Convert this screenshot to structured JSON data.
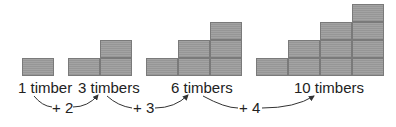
{
  "diagram": {
    "groups": [
      {
        "label": "1 timber",
        "count": 1,
        "columns": [
          1
        ]
      },
      {
        "label": "3 timbers",
        "count": 3,
        "columns": [
          1,
          2
        ]
      },
      {
        "label": "6 timbers",
        "count": 6,
        "columns": [
          1,
          2,
          3
        ]
      },
      {
        "label": "10 timbers",
        "count": 10,
        "columns": [
          1,
          2,
          3,
          4
        ]
      }
    ],
    "increments": [
      {
        "label": "+ 2"
      },
      {
        "label": "+ 3"
      },
      {
        "label": "+ 4"
      }
    ],
    "colors": {
      "block": "#9b9b9b",
      "block_edge": "#7a7a7a",
      "text": "#222222",
      "arrow": "#333333"
    }
  }
}
